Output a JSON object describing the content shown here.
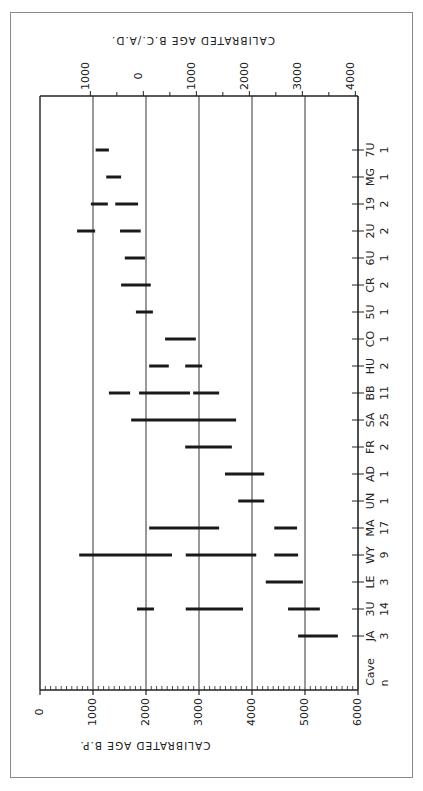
{
  "chart_data": {
    "type": "bar",
    "subtype": "range-bar (horizontal floating ranges, figure printed rotated 90°)",
    "title": "",
    "xlabel": "CALIBRATED AGE B.P.",
    "x2label": "CALIBRATED AGE B.C./A.D.",
    "ylabel_cave": "Cave",
    "ylabel_n": "n",
    "xlim": [
      0,
      6000
    ],
    "x_ticks": [
      "0",
      "1000",
      "2000",
      "3000",
      "4000",
      "5000",
      "6000"
    ],
    "x2_ticks": [
      "1000",
      "0",
      "1000",
      "2000",
      "3000",
      "4000"
    ],
    "grid": true,
    "legend": null,
    "categories": [
      "7U",
      "MG",
      "19",
      "2U",
      "6U",
      "CR",
      "5U",
      "CO",
      "HU",
      "BB",
      "SA",
      "FR",
      "AD",
      "UN",
      "MA",
      "WY",
      "LE",
      "3U",
      "JA"
    ],
    "n": [
      "1",
      "1",
      "2",
      "2",
      "1",
      "2",
      "1",
      "1",
      "2",
      "11",
      "25",
      "2",
      "1",
      "1",
      "17",
      "9",
      "3",
      "14",
      "3"
    ],
    "ranges_bp": [
      [
        [
          1050,
          1300
        ]
      ],
      [
        [
          1250,
          1530
        ]
      ],
      [
        [
          960,
          1280
        ],
        [
          1420,
          1850
        ]
      ],
      [
        [
          700,
          1040
        ],
        [
          1510,
          1900
        ]
      ],
      [
        [
          1600,
          1980
        ]
      ],
      [
        [
          1530,
          2090
        ]
      ],
      [
        [
          1810,
          2130
        ]
      ],
      [
        [
          2360,
          2940
        ]
      ],
      [
        [
          2060,
          2430
        ],
        [
          2740,
          3060
        ]
      ],
      [
        [
          1300,
          1700
        ],
        [
          1870,
          2830
        ],
        [
          2890,
          3380
        ]
      ],
      [
        [
          1720,
          3700
        ]
      ],
      [
        [
          2740,
          3620
        ]
      ],
      [
        [
          3490,
          4230
        ]
      ],
      [
        [
          3740,
          4230
        ]
      ],
      [
        [
          2060,
          3380
        ],
        [
          4420,
          4850
        ]
      ],
      [
        [
          740,
          2490
        ],
        [
          2750,
          4080
        ],
        [
          4420,
          4870
        ]
      ],
      [
        [
          4260,
          4960
        ]
      ],
      [
        [
          1830,
          2150
        ],
        [
          2750,
          3830
        ],
        [
          4680,
          5280
        ]
      ],
      [
        [
          4870,
          5620
        ]
      ]
    ]
  },
  "layout": {
    "bp_axis_labels": [
      "0",
      "1000",
      "2000",
      "3000",
      "4000",
      "5000",
      "6000"
    ],
    "bcad_axis_labels": [
      "1000",
      "0",
      "1000",
      "2000",
      "3000",
      "4000"
    ],
    "bp_axis_title": "CALIBRATED AGE B.P.",
    "bcad_axis_title": "CALIBRATED AGE B.C./A.D.",
    "cave_header": "Cave",
    "n_header": "n"
  },
  "colors": {
    "bar": "#1a1a1a",
    "grid": "#555555",
    "frame": "#8a8a8a"
  }
}
